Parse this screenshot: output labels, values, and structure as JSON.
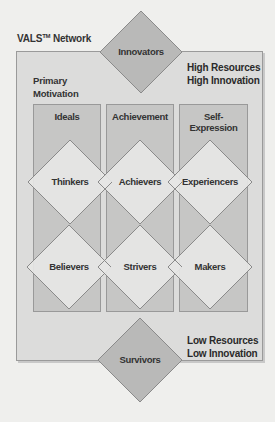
{
  "title": "VALS",
  "title_tm": "TM",
  "title_suffix": " Network",
  "primary_motivation": [
    "Primary",
    "Motivation"
  ],
  "top_right": [
    "High Resources",
    "High Innovation"
  ],
  "bottom_right": [
    "Low Resources",
    "Low Innovation"
  ],
  "columns": [
    {
      "label": "Ideals"
    },
    {
      "label": "Achievement"
    },
    {
      "label": "Self-Expression"
    }
  ],
  "top_node": "Innovators",
  "bottom_node": "Survivors",
  "upper_row": [
    "Thinkers",
    "Achievers",
    "Experiencers"
  ],
  "lower_row": [
    "Believers",
    "Strivers",
    "Makers"
  ],
  "colors": {
    "outer_box": "#dcdcdb",
    "column": "#c6c6c5",
    "segment_diamond": "#e6e6e5",
    "extreme_diamond": "#b9b9b8",
    "line": "#8a8a8a"
  }
}
